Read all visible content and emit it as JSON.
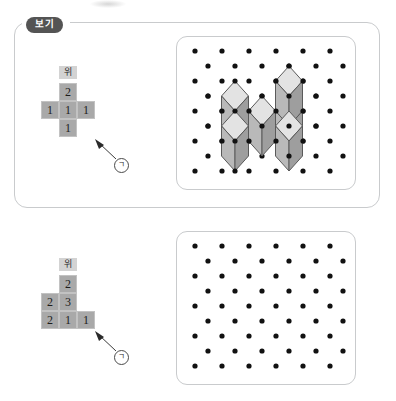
{
  "document": {
    "type": "math-worksheet",
    "language": "ko",
    "example_tag": "보기"
  },
  "colors": {
    "panel_border": "#c9cbcd",
    "tag_background": "#545454",
    "tag_text": "#ffffff",
    "cell_fill": "#a9a9a9",
    "cell_border": "#c2c2c2",
    "label_fill": "#d3d3d3",
    "dot_color": "#111111",
    "cube_top": "#e3e3e3",
    "cube_left": "#b9b9b9",
    "cube_right": "#9e9e9e",
    "cube_outline": "#5a5a5a"
  },
  "sections": [
    {
      "id": "example-section",
      "name": "example",
      "has_outer_panel": true,
      "tag": "보기",
      "figure": {
        "name": "top-view-grid-example",
        "above_label": "위",
        "above_label_column": 1,
        "columns": 3,
        "rows": [
          [
            null,
            "2",
            null
          ],
          [
            "1",
            "1",
            "1"
          ],
          [
            null,
            "1",
            null
          ]
        ]
      },
      "callout": {
        "name": "callout-marker-example",
        "symbol": "ㄱ",
        "label": "㉠"
      },
      "dot_grid": {
        "name": "isometric-dot-grid-example",
        "cols": 6,
        "rows": 9,
        "filled": true,
        "cubes_present": true,
        "cube_count": 6,
        "cube_layout": {
          "description": "isometric stack matching the top view grid",
          "base_cubes": [
            "left",
            "center",
            "front",
            "right-tall-base"
          ],
          "stacked_cubes": [
            "right-tall-top"
          ]
        }
      }
    },
    {
      "id": "problem-section",
      "name": "problem",
      "has_outer_panel": false,
      "tag": null,
      "figure": {
        "name": "top-view-grid-problem",
        "above_label": "위",
        "above_label_column": 1,
        "columns": 3,
        "rows": [
          [
            null,
            "2",
            null
          ],
          [
            "2",
            "3",
            null
          ],
          [
            "2",
            "1",
            "1"
          ]
        ]
      },
      "callout": {
        "name": "callout-marker-problem",
        "symbol": "ㄱ",
        "label": "㉠"
      },
      "dot_grid": {
        "name": "isometric-dot-grid-problem",
        "cols": 6,
        "rows": 9,
        "filled": false,
        "cubes_present": false,
        "cube_count": 0
      }
    }
  ]
}
